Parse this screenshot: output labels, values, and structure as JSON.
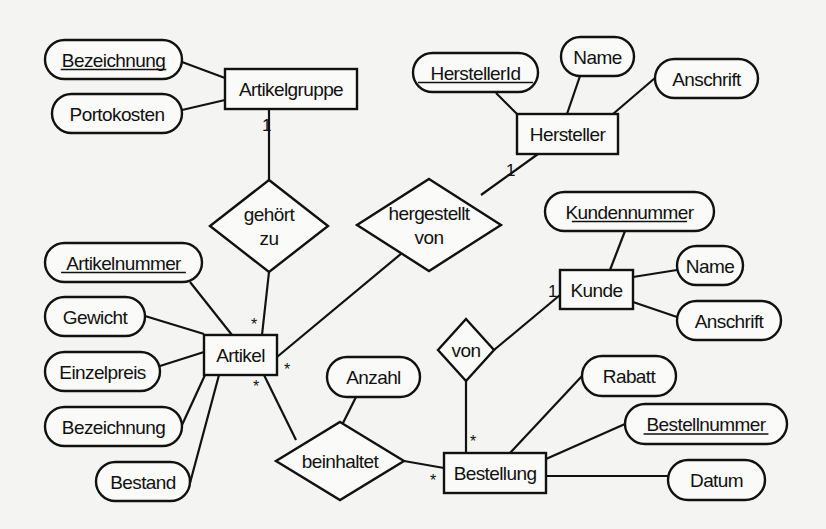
{
  "diagram": {
    "type": "entity-relationship",
    "background": "#f4f4f2",
    "ink": "#111111",
    "entities": [
      {
        "id": "artikelgruppe",
        "label": "Artikelgruppe",
        "x": 225,
        "y": 69,
        "w": 132,
        "h": 40
      },
      {
        "id": "hersteller",
        "label": "Hersteller",
        "x": 517,
        "y": 114,
        "w": 101,
        "h": 40
      },
      {
        "id": "kunde",
        "label": "Kunde",
        "x": 560,
        "y": 270,
        "w": 73,
        "h": 39
      },
      {
        "id": "artikel",
        "label": "Artikel",
        "x": 204,
        "y": 335,
        "w": 73,
        "h": 40
      },
      {
        "id": "bestellung",
        "label": "Bestellung",
        "x": 444,
        "y": 453,
        "w": 102,
        "h": 40
      }
    ],
    "attributes": [
      {
        "id": "ag_bezeichnung",
        "label": "Bezeichnung",
        "key": true,
        "owner": "artikelgruppe",
        "x": 45,
        "y": 40,
        "w": 137,
        "h": 39
      },
      {
        "id": "ag_portokosten",
        "label": "Portokosten",
        "key": false,
        "owner": "artikelgruppe",
        "x": 52,
        "y": 94,
        "w": 130,
        "h": 39
      },
      {
        "id": "h_herstellerid",
        "label": "HerstellerId",
        "key": true,
        "owner": "hersteller",
        "x": 413,
        "y": 53,
        "w": 125,
        "h": 39
      },
      {
        "id": "h_name",
        "label": "Name",
        "key": false,
        "owner": "hersteller",
        "x": 561,
        "y": 37,
        "w": 73,
        "h": 39
      },
      {
        "id": "h_anschrift",
        "label": "Anschrift",
        "key": false,
        "owner": "hersteller",
        "x": 655,
        "y": 59,
        "w": 103,
        "h": 39
      },
      {
        "id": "k_kundennummer",
        "label": "Kundennummer",
        "key": true,
        "owner": "kunde",
        "x": 545,
        "y": 192,
        "w": 169,
        "h": 39
      },
      {
        "id": "k_name",
        "label": "Name",
        "key": false,
        "owner": "kunde",
        "x": 677,
        "y": 246,
        "w": 66,
        "h": 39
      },
      {
        "id": "k_anschrift",
        "label": "Anschrift",
        "key": false,
        "owner": "kunde",
        "x": 677,
        "y": 301,
        "w": 104,
        "h": 39
      },
      {
        "id": "a_artikelnummer",
        "label": "Artikelnummer",
        "key": true,
        "owner": "artikel",
        "x": 45,
        "y": 243,
        "w": 157,
        "h": 39
      },
      {
        "id": "a_gewicht",
        "label": "Gewicht",
        "key": false,
        "owner": "artikel",
        "x": 45,
        "y": 297,
        "w": 100,
        "h": 39
      },
      {
        "id": "a_einzelpreis",
        "label": "Einzelpreis",
        "key": false,
        "owner": "artikel",
        "x": 45,
        "y": 352,
        "w": 115,
        "h": 39
      },
      {
        "id": "a_bezeichnung",
        "label": "Bezeichnung",
        "key": false,
        "owner": "artikel",
        "x": 45,
        "y": 407,
        "w": 137,
        "h": 39
      },
      {
        "id": "a_bestand",
        "label": "Bestand",
        "key": false,
        "owner": "artikel",
        "x": 96,
        "y": 462,
        "w": 94,
        "h": 39
      },
      {
        "id": "r_anzahl",
        "label": "Anzahl",
        "key": false,
        "owner": "beinhaltet",
        "x": 327,
        "y": 357,
        "w": 93,
        "h": 40
      },
      {
        "id": "b_rabatt",
        "label": "Rabatt",
        "key": false,
        "owner": "bestellung",
        "x": 582,
        "y": 356,
        "w": 94,
        "h": 40
      },
      {
        "id": "b_bestellnummer",
        "label": "Bestellnummer",
        "key": true,
        "owner": "bestellung",
        "x": 625,
        "y": 404,
        "w": 162,
        "h": 40
      },
      {
        "id": "b_datum",
        "label": "Datum",
        "key": false,
        "owner": "bestellung",
        "x": 668,
        "y": 460,
        "w": 97,
        "h": 40
      }
    ],
    "relationships": [
      {
        "id": "gehoert_zu",
        "lines": [
          "gehört",
          "zu"
        ],
        "cx": 269,
        "cy": 226,
        "rx": 59,
        "ry": 46
      },
      {
        "id": "hergestellt_von",
        "lines": [
          "hergestellt",
          "von"
        ],
        "cx": 429,
        "cy": 225,
        "rx": 72,
        "ry": 46
      },
      {
        "id": "von",
        "lines": [
          "von"
        ],
        "cx": 466,
        "cy": 350,
        "rx": 28,
        "ry": 31
      },
      {
        "id": "beinhaltet",
        "lines": [
          "beinhaltet"
        ],
        "cx": 340,
        "cy": 461,
        "rx": 64,
        "ry": 39
      }
    ],
    "edges": [
      {
        "from": [
          182,
          62
        ],
        "to": [
          225,
          78
        ]
      },
      {
        "from": [
          182,
          110
        ],
        "to": [
          225,
          100
        ]
      },
      {
        "from": [
          269,
          109
        ],
        "to": [
          269,
          180
        ]
      },
      {
        "from": [
          269,
          272
        ],
        "to": [
          262,
          335
        ]
      },
      {
        "from": [
          496,
          93
        ],
        "to": [
          517,
          114
        ]
      },
      {
        "from": [
          580,
          76
        ],
        "to": [
          567,
          114
        ]
      },
      {
        "from": [
          655,
          78
        ],
        "to": [
          613,
          114
        ]
      },
      {
        "from": [
          538,
          154
        ],
        "to": [
          481,
          195
        ]
      },
      {
        "from": [
          402,
          253
        ],
        "to": [
          277,
          357
        ]
      },
      {
        "from": [
          625,
          231
        ],
        "to": [
          610,
          270
        ]
      },
      {
        "from": [
          633,
          277
        ],
        "to": [
          677,
          270
        ]
      },
      {
        "from": [
          633,
          302
        ],
        "to": [
          677,
          317
        ]
      },
      {
        "from": [
          560,
          295
        ],
        "to": [
          494,
          350
        ]
      },
      {
        "from": [
          466,
          381
        ],
        "to": [
          466,
          453
        ]
      },
      {
        "from": [
          190,
          282
        ],
        "to": [
          232,
          335
        ]
      },
      {
        "from": [
          145,
          316
        ],
        "to": [
          204,
          334
        ]
      },
      {
        "from": [
          160,
          366
        ],
        "to": [
          204,
          352
        ]
      },
      {
        "from": [
          182,
          425
        ],
        "to": [
          205,
          375
        ]
      },
      {
        "from": [
          190,
          483
        ],
        "to": [
          219,
          375
        ]
      },
      {
        "from": [
          264,
          375
        ],
        "to": [
          296,
          440
        ]
      },
      {
        "from": [
          356,
          397
        ],
        "to": [
          342,
          425
        ]
      },
      {
        "from": [
          404,
          461
        ],
        "to": [
          444,
          468
        ]
      },
      {
        "from": [
          582,
          376
        ],
        "to": [
          510,
          453
        ]
      },
      {
        "from": [
          625,
          424
        ],
        "to": [
          546,
          459
        ]
      },
      {
        "from": [
          546,
          476
        ],
        "to": [
          668,
          476
        ]
      }
    ],
    "cardinalities": [
      {
        "label": "1",
        "x": 262,
        "y": 131,
        "kind": "one"
      },
      {
        "label": "1",
        "x": 506,
        "y": 176,
        "kind": "one"
      },
      {
        "label": "1",
        "x": 548,
        "y": 297,
        "kind": "one"
      },
      {
        "label": "*",
        "x": 251,
        "y": 330,
        "kind": "many"
      },
      {
        "label": "*",
        "x": 284,
        "y": 375,
        "kind": "many"
      },
      {
        "label": "*",
        "x": 253,
        "y": 392,
        "kind": "many"
      },
      {
        "label": "*",
        "x": 470,
        "y": 447,
        "kind": "many"
      },
      {
        "label": "*",
        "x": 430,
        "y": 486,
        "kind": "many"
      }
    ]
  }
}
